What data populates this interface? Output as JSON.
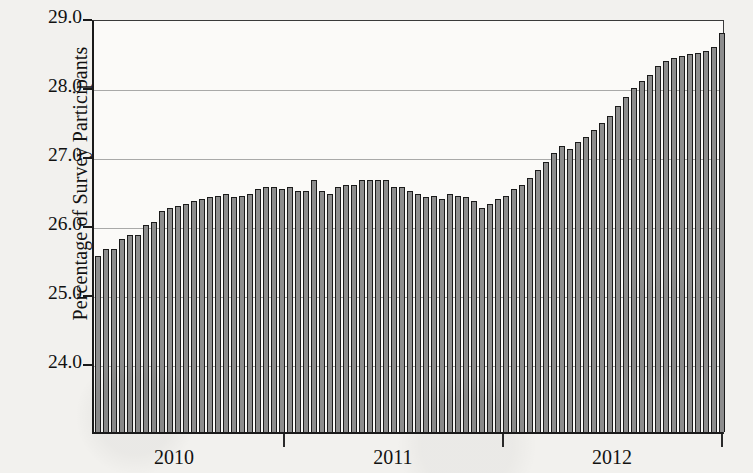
{
  "chart_data": {
    "type": "bar",
    "title": "",
    "xlabel": "",
    "ylabel": "Percentage of Survey Participants",
    "ylim": [
      23.0,
      29.0
    ],
    "ytick_labels": [
      "29.0",
      "28.0",
      "27.0",
      "26.0",
      "25.0",
      "24.0"
    ],
    "ytick_values": [
      29.0,
      28.0,
      27.0,
      26.0,
      25.0,
      24.0
    ],
    "gridlines": [
      28.0,
      27.0,
      26.0,
      25.0,
      24.0
    ],
    "grid": true,
    "legend": "none",
    "xtick_labels": [
      "2010",
      "2011",
      "2012"
    ],
    "xtick_values": [
      2010,
      2011,
      2012
    ],
    "bar_color": "#8d8d8d",
    "bar_edge_color": "#1b1b1b",
    "plot_background": "#fbfaf8",
    "page_background": "#f2f1ee",
    "axis_color": "#1a1a1a",
    "n_bars": 79,
    "values": [
      25.55,
      25.65,
      25.65,
      25.8,
      25.85,
      25.85,
      26.0,
      26.05,
      26.2,
      26.25,
      26.28,
      26.3,
      26.35,
      26.38,
      26.4,
      26.42,
      26.45,
      26.4,
      26.42,
      26.45,
      26.52,
      26.55,
      26.55,
      26.52,
      26.55,
      26.5,
      26.5,
      26.65,
      26.5,
      26.45,
      26.55,
      26.58,
      26.58,
      26.65,
      26.65,
      26.65,
      26.65,
      26.55,
      26.55,
      26.5,
      26.45,
      26.4,
      26.42,
      26.38,
      26.45,
      26.42,
      26.4,
      26.35,
      26.25,
      26.3,
      26.38,
      26.42,
      26.52,
      26.58,
      26.68,
      26.8,
      26.92,
      27.05,
      27.15,
      27.1,
      27.2,
      27.28,
      27.38,
      27.48,
      27.58,
      27.72,
      27.85,
      27.98,
      28.08,
      28.18,
      28.3,
      28.38,
      28.42,
      28.45,
      28.48,
      28.5,
      28.52,
      28.58,
      28.78
    ]
  }
}
